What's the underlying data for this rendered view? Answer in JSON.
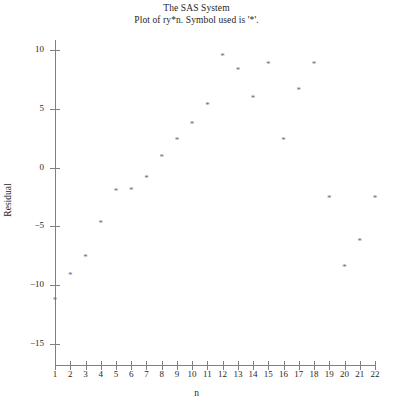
{
  "title": {
    "line1": "The SAS System",
    "line2": "Plot of ry*n. Symbol used is '*'."
  },
  "axes": {
    "xlabel": "n",
    "ylabel": "Residual",
    "x_ticks": [
      1,
      2,
      3,
      4,
      5,
      6,
      7,
      8,
      9,
      10,
      11,
      12,
      13,
      14,
      15,
      16,
      17,
      18,
      19,
      20,
      21,
      22
    ],
    "y_ticks": [
      10,
      5,
      0,
      -5,
      -10,
      -15
    ],
    "xlim": [
      0.4,
      22.6
    ],
    "ylim": [
      -16.5,
      11.5
    ],
    "grid": false
  },
  "marker": {
    "glyph": "*",
    "color": "#6b6b73"
  },
  "chart_data": {
    "type": "scatter",
    "title": "Plot of ry*n. Symbol used is '*'.",
    "xlabel": "n",
    "ylabel": "Residual",
    "xlim": [
      0.4,
      22.6
    ],
    "ylim": [
      -16.5,
      11.5
    ],
    "grid": false,
    "legend": null,
    "series": [
      {
        "name": "ry",
        "marker": "*",
        "x": [
          1,
          2,
          3,
          4,
          5,
          6,
          7,
          8,
          9,
          10,
          11,
          12,
          13,
          14,
          15,
          16,
          17,
          18,
          19,
          20,
          21,
          22
        ],
        "y": [
          -11.3,
          -9.2,
          -7.7,
          -4.8,
          -2.1,
          -2.0,
          -1.0,
          0.8,
          2.3,
          3.6,
          5.2,
          9.4,
          8.2,
          5.8,
          8.7,
          2.3,
          6.5,
          8.7,
          -2.7,
          -8.5,
          -6.3,
          -2.7
        ]
      }
    ]
  }
}
